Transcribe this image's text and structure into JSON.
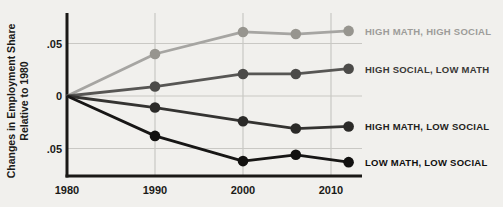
{
  "page": {
    "background": "#f1f0ed"
  },
  "chart_data": {
    "type": "line",
    "title": "",
    "ylabel_line1": "Changes in Employment Share",
    "ylabel_line2": "Relative to 1980",
    "xlabel": "",
    "x": [
      1980,
      1990,
      2000,
      2006,
      2012
    ],
    "x_ticks": [
      {
        "label": "1980",
        "value": 1980
      },
      {
        "label": "1990",
        "value": 1990
      },
      {
        "label": "2000",
        "value": 2000
      },
      {
        "label": "2010",
        "value": 2010
      }
    ],
    "y_ticks": [
      {
        "label": ".05",
        "value": 0.05
      },
      {
        "label": "0",
        "value": 0
      },
      {
        "label": ".05",
        "value": -0.05
      }
    ],
    "x_range": [
      1980,
      2013.5
    ],
    "y_range": [
      -0.076,
      0.079
    ],
    "grid": true,
    "legend_position": "right-of-line-ends",
    "axis_color": "#1a1916",
    "grid_color": "#c9c8c4",
    "tick_label_color": "#1b1a18",
    "series": [
      {
        "name": "HIGH MATH, HIGH SOCIAL",
        "values": [
          0,
          0.04,
          0.061,
          0.059,
          0.062
        ],
        "line_color": "#a6a5a2",
        "marker_color": "#97958f",
        "label_color": "#9d9c99"
      },
      {
        "name": "HIGH SOCIAL, LOW MATH",
        "values": [
          0,
          0.009,
          0.021,
          0.021,
          0.026
        ],
        "line_color": "#575654",
        "marker_color": "#4c4b49",
        "label_color": "#393836"
      },
      {
        "name": "HIGH MATH, LOW SOCIAL",
        "values": [
          0,
          -0.011,
          -0.024,
          -0.031,
          -0.029
        ],
        "line_color": "#343331",
        "marker_color": "#2b2a28",
        "label_color": "#232220"
      },
      {
        "name": "LOW MATH, LOW SOCIAL",
        "values": [
          0,
          -0.038,
          -0.062,
          -0.056,
          -0.063
        ],
        "line_color": "#171615",
        "marker_color": "#121110",
        "label_color": "#0f0e0d"
      }
    ]
  }
}
